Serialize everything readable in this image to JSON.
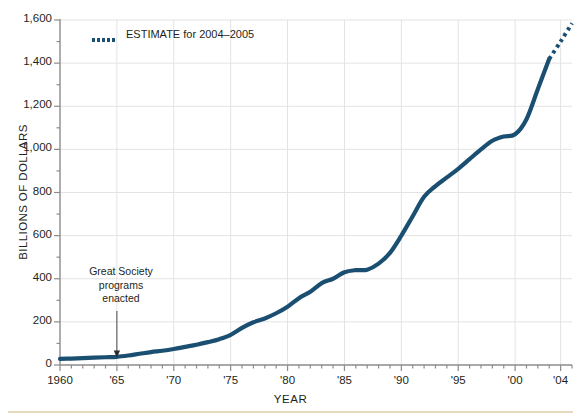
{
  "chart_data": {
    "type": "line",
    "title": "",
    "xlabel": "YEAR",
    "ylabel": "BILLIONS OF DOLLARS",
    "xlim": [
      1960,
      2005
    ],
    "ylim": [
      0,
      1600
    ],
    "grid": true,
    "legend_position": "top-left-inside",
    "x_tick_labels": [
      "1960",
      "'65",
      "'70",
      "'75",
      "'80",
      "'85",
      "'90",
      "'95",
      "'00",
      "'04"
    ],
    "x_tick_values": [
      1960,
      1965,
      1970,
      1975,
      1980,
      1985,
      1990,
      1995,
      2000,
      2004
    ],
    "y_tick_labels": [
      "0",
      "200",
      "400",
      "600",
      "800",
      "1,000",
      "1,200",
      "1,400",
      "1,600"
    ],
    "y_tick_values": [
      0,
      200,
      400,
      600,
      800,
      1000,
      1200,
      1400,
      1600
    ],
    "series": [
      {
        "name": "Actual",
        "style": "solid",
        "color": "#1b4f72",
        "x": [
          1960,
          1961,
          1962,
          1963,
          1964,
          1965,
          1966,
          1967,
          1968,
          1969,
          1970,
          1971,
          1972,
          1973,
          1974,
          1975,
          1976,
          1977,
          1978,
          1979,
          1980,
          1981,
          1982,
          1983,
          1984,
          1985,
          1986,
          1987,
          1988,
          1989,
          1990,
          1991,
          1992,
          1993,
          1994,
          1995,
          1996,
          1997,
          1998,
          1999,
          2000,
          2001,
          2002,
          2003
        ],
        "values": [
          28,
          30,
          32,
          34,
          36,
          38,
          44,
          52,
          60,
          66,
          74,
          84,
          94,
          106,
          120,
          140,
          172,
          198,
          216,
          240,
          270,
          310,
          340,
          380,
          400,
          430,
          440,
          442,
          470,
          520,
          600,
          690,
          780,
          830,
          870,
          910,
          955,
          1000,
          1040,
          1060,
          1070,
          1140,
          1280,
          1420
        ]
      },
      {
        "name": "ESTIMATE for 2004-2005",
        "style": "dotted",
        "color": "#1b4f72",
        "x": [
          2003,
          2004,
          2005
        ],
        "values": [
          1420,
          1500,
          1585
        ]
      }
    ],
    "annotations": [
      {
        "text_lines": [
          "Great Society",
          "programs",
          "enacted"
        ],
        "x": 1965,
        "y": 40,
        "arrow": "down"
      }
    ]
  },
  "legend": {
    "estimate_label": "ESTIMATE for 2004–2005"
  },
  "axes": {
    "y_title": "BILLIONS OF DOLLARS",
    "x_title": "YEAR"
  },
  "annotation": {
    "line1": "Great Society",
    "line2": "programs",
    "line3": "enacted"
  },
  "colors": {
    "line": "#1b4f72",
    "grid": "#e3e3e3",
    "axis": "#8c8c8c",
    "rule": "#e8d9bf"
  },
  "y_ticks": [
    {
      "label": "1,600"
    },
    {
      "label": "1,400"
    },
    {
      "label": "1,200"
    },
    {
      "label": "1,000"
    },
    {
      "label": "800"
    },
    {
      "label": "600"
    },
    {
      "label": "400"
    },
    {
      "label": "200"
    },
    {
      "label": "0"
    }
  ],
  "x_ticks": [
    {
      "label": "1960"
    },
    {
      "label": "'65"
    },
    {
      "label": "'70"
    },
    {
      "label": "'75"
    },
    {
      "label": "'80"
    },
    {
      "label": "'85"
    },
    {
      "label": "'90"
    },
    {
      "label": "'95"
    },
    {
      "label": "'00"
    },
    {
      "label": "'04"
    }
  ]
}
